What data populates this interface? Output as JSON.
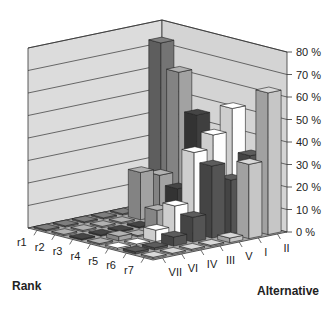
{
  "chart_data": {
    "type": "bar",
    "subtype": "3d-bar",
    "title": "",
    "xlabel": "Rank",
    "ylabel": "Alternative",
    "zlabel": "",
    "z_ticks": [
      "0 %",
      "10 %",
      "20 %",
      "30 %",
      "40 %",
      "50 %",
      "60 %",
      "70 %",
      "80 %"
    ],
    "zlim": [
      0,
      80
    ],
    "ranks": [
      "r1",
      "r2",
      "r3",
      "r4",
      "r5",
      "r6",
      "r7"
    ],
    "alternatives": [
      "II",
      "I",
      "V",
      "III",
      "IV",
      "VI",
      "VII"
    ],
    "series": [
      {
        "name": "II",
        "color": "#6e6e6e",
        "values": [
          73,
          0,
          0,
          0,
          0,
          0,
          0
        ]
      },
      {
        "name": "I",
        "color": "#9a9a9a",
        "values": [
          62,
          18,
          21,
          0,
          0,
          0,
          0
        ]
      },
      {
        "name": "V",
        "color": "#3c3c3c",
        "values": [
          45,
          14,
          3,
          0,
          0,
          0,
          0
        ]
      },
      {
        "name": "III",
        "color": "#9c9c9c",
        "values": [
          0,
          0,
          0,
          10,
          0,
          2,
          0
        ]
      },
      {
        "name": "IV",
        "color": "#f2f2f2",
        "values": [
          52,
          42,
          36,
          14,
          5,
          0,
          0
        ]
      },
      {
        "name": "VI",
        "color": "#505050",
        "values": [
          33,
          24,
          32,
          11,
          4,
          1,
          1
        ]
      },
      {
        "name": "VII",
        "color": "#bdbdbd",
        "values": [
          63,
          33,
          2,
          0,
          0,
          0,
          0
        ]
      }
    ],
    "legend": "none",
    "grid": true
  },
  "labels": {
    "rank_axis_title": "Rank",
    "alternative_axis_title": "Alternative"
  }
}
